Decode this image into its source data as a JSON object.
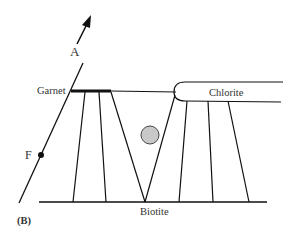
{
  "diagram": {
    "panel_label": "(B)",
    "labels": {
      "garnet": "Garnet",
      "chlorite": "Chlorite",
      "biotite": "Biotite",
      "arrow_a": "A",
      "point_f": "F"
    },
    "colors": {
      "line": "#111111",
      "circle_fill": "#c8c8c8",
      "circle_stroke": "#444444"
    }
  }
}
